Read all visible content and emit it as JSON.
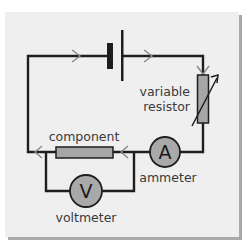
{
  "diagram": {
    "type": "circuit",
    "title": "",
    "colors": {
      "background": "#ffffff",
      "panel": "#efefef",
      "panel_shadow": "#a9a9a9",
      "wire": "#1e1e1e",
      "component_fill": "#a6a6a6",
      "meter_fill": "#a9a9a9",
      "arrow": "#8a8a8a",
      "label_text": "#3a3a3a"
    },
    "components": {
      "cell": {
        "label": ""
      },
      "variable_resistor": {
        "label_line1": "variable",
        "label_line2": "resistor"
      },
      "component": {
        "label": "component"
      },
      "ammeter": {
        "symbol": "A",
        "label": "ammeter"
      },
      "voltmeter": {
        "symbol": "V",
        "label": "voltmeter"
      }
    },
    "current_arrows": [
      {
        "position": "top-left-wire",
        "direction": "right"
      },
      {
        "position": "top-right-wire",
        "direction": "right"
      },
      {
        "position": "right-wire-top",
        "direction": "down"
      },
      {
        "position": "bottom-wire-right-of-component",
        "direction": "left"
      },
      {
        "position": "bottom-wire-left-of-component",
        "direction": "left"
      }
    ],
    "connections": [
      "cell -> variable resistor",
      "variable resistor -> ammeter",
      "ammeter -> component",
      "component -> cell",
      "voltmeter in parallel with component"
    ]
  }
}
